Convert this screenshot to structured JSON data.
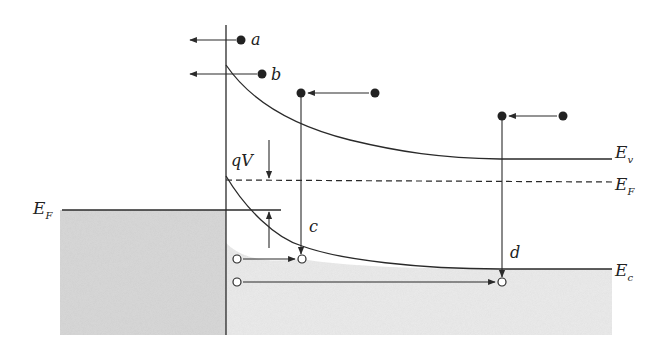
{
  "diagram": {
    "type": "energy-band-diagram",
    "colors": {
      "line": "#2a2a2a",
      "metal_fill": "#d9d9d9",
      "semiconductor_fill": "#ececec",
      "background": "#ffffff",
      "electron_filled": "#222222",
      "hole_open": "#ffffff"
    },
    "labels": {
      "metal_fermi": {
        "main": "E",
        "sub": "F"
      },
      "valence_band": {
        "main": "E",
        "sub": "v"
      },
      "semi_fermi": {
        "main": "E",
        "sub": "F"
      },
      "conduction_band": {
        "main": "E",
        "sub": "c"
      },
      "barrier": "qV",
      "process_a": "a",
      "process_b": "b",
      "process_c": "c",
      "process_d": "d"
    },
    "carriers": {
      "filled_dots": [
        {
          "id": "a-electron",
          "x": 241,
          "y": 40
        },
        {
          "id": "b-electron",
          "x": 262,
          "y": 74
        },
        {
          "id": "c-source",
          "x": 375,
          "y": 93
        },
        {
          "id": "c-target",
          "x": 301,
          "y": 93
        },
        {
          "id": "d-source",
          "x": 563,
          "y": 116
        },
        {
          "id": "d-target",
          "x": 502,
          "y": 116
        }
      ],
      "open_circles": [
        {
          "id": "c-hole-source",
          "x": 237,
          "y": 259
        },
        {
          "id": "c-hole-target",
          "x": 302,
          "y": 259
        },
        {
          "id": "d-hole-source",
          "x": 237,
          "y": 282
        },
        {
          "id": "d-hole-target",
          "x": 502,
          "y": 282
        }
      ]
    }
  }
}
